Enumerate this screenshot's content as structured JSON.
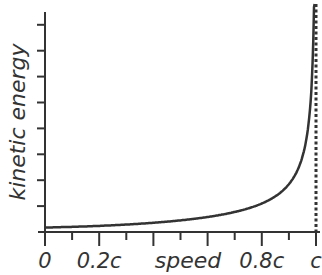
{
  "chart_data": {
    "type": "line",
    "title": "",
    "xlabel": "speed",
    "ylabel": "kinetic energy",
    "x_tick_labels": [
      "0",
      "0.2c",
      "0.8c",
      "c"
    ],
    "x_tick_label_positions": [
      0,
      0.2,
      0.8,
      1.0
    ],
    "xlim": [
      0,
      1.0
    ],
    "y_tick_count": 8,
    "y_tick_labels": [],
    "grid": false,
    "legend": null,
    "series": [
      {
        "name": "kinetic energy vs speed",
        "x": [
          0,
          0.1,
          0.2,
          0.3,
          0.4,
          0.5,
          0.6,
          0.7,
          0.8,
          0.85,
          0.9,
          0.93,
          0.95,
          0.97,
          0.98,
          0.99,
          0.995
        ],
        "y": [
          0,
          0.005,
          0.02,
          0.048,
          0.091,
          0.155,
          0.25,
          0.4,
          0.667,
          0.898,
          1.294,
          1.72,
          2.203,
          3.113,
          4.025,
          6.089,
          9.01
        ]
      }
    ],
    "annotations": [
      {
        "type": "vertical-dashed-line",
        "x": 1.0,
        "label": "c",
        "meaning": "speed of light asymptote"
      }
    ]
  }
}
